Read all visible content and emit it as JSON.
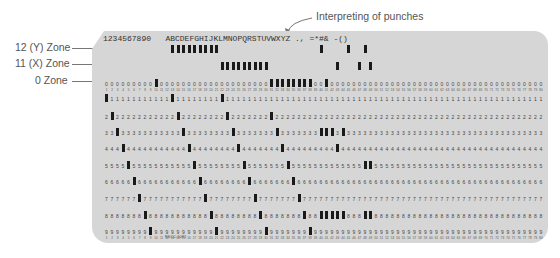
{
  "annotations": {
    "interpreting": "Interpreting of punches",
    "zone12": "12 (Y) Zone",
    "zone11": "11 (X) Zone",
    "zone0": "0 Zone"
  },
  "card": {
    "printed_segments": [
      {
        "text": "1234567890",
        "start_col": 1
      },
      {
        "text": "ABCDEFGHIJKLMNOPQRSTUVWXYZ",
        "start_col": 13
      },
      {
        "text": ".,=*#&",
        "start_col": 40
      },
      {
        "text": "-()",
        "start_col": 47
      }
    ],
    "printed_line": "1234567890   ABCDEFGHIJKLMNOPQRSTUVWXYZ ., =*#& -()",
    "columns": 80,
    "row_digits": [
      "0",
      "1",
      "2",
      "3",
      "4",
      "5",
      "6",
      "7",
      "8",
      "9"
    ],
    "form_code": "NSCC-5081",
    "colors": {
      "card": "#d6d6d6",
      "punch": "#1a1a1a",
      "digit": "#444444"
    }
  }
}
